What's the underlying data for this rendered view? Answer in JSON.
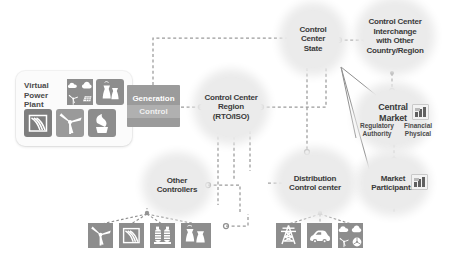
{
  "diagram": {
    "background_color": "#ffffff",
    "node_fill": "#ebebeb",
    "tile_fill": "#8d8d8d",
    "block_fill": "#9b9b9b",
    "line_color": "#9a9a9a"
  },
  "panels": {
    "virtual_power_plant": {
      "label": "Virtual\nPower\nPlant",
      "icons": [
        "solar-cloud-quad-icon",
        "cooling-towers-icon",
        "hydro-dam-icon",
        "wind-turbine-icon",
        "biomass-icon"
      ]
    },
    "generation_control": {
      "line1": "Generation",
      "line2": "Control"
    }
  },
  "nodes": [
    {
      "id": "control-center-region",
      "label": "Control Center\nRegion\n(RTO/ISO)"
    },
    {
      "id": "control-center-state",
      "label": "Control\nCenter\nState"
    },
    {
      "id": "control-center-interchange",
      "label": "Control Center\nInterchange\nwith Other\nCountry/Region"
    },
    {
      "id": "central-market",
      "label": "Central\nMarket"
    },
    {
      "id": "market-participants",
      "label": "Market\nParticipants"
    },
    {
      "id": "other-controllers",
      "label": "Other\nControllers"
    },
    {
      "id": "distribution-control-center",
      "label": "Distribution\nControl center"
    }
  ],
  "annotations": [
    {
      "id": "regulatory-authority",
      "label": "Regulatory\nAuthority"
    },
    {
      "id": "financial-physical",
      "label": "Financial\nPhysical"
    }
  ],
  "device_groups": {
    "other_controllers_devices": [
      "wind-turbine-icon",
      "hydro-dam-icon",
      "transformer-icon",
      "cooling-towers-icon"
    ],
    "distribution_devices": [
      "transmission-tower-icon",
      "electric-vehicle-icon",
      "mixed-resources-quad-icon"
    ]
  },
  "badges": [
    {
      "id": "central-market-chart",
      "icon": "bar-chart-icon"
    },
    {
      "id": "market-participants-chart",
      "icon": "bar-chart-icon"
    }
  ]
}
